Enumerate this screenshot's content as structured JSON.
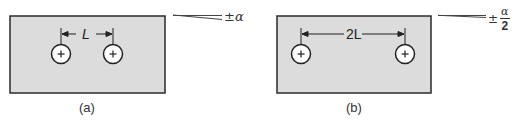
{
  "figure": {
    "panels": [
      {
        "id": "a",
        "caption": "(a)",
        "dimension_label": "L",
        "tolerance_prefix": "±",
        "tolerance_symbol": "α",
        "holes": 2
      },
      {
        "id": "b",
        "caption": "(b)",
        "dimension_label": "2L",
        "tolerance_prefix": "±",
        "tolerance_numerator": "α",
        "tolerance_denominator": "2",
        "holes": 2
      }
    ],
    "colors": {
      "plate_fill": "#dcdcdc",
      "plate_stroke": "#2a2a2a",
      "hole_fill": "#ffffff",
      "line": "#333333"
    }
  }
}
